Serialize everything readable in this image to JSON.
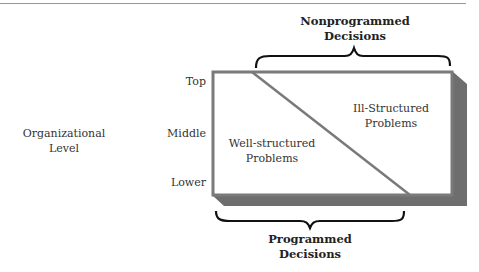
{
  "axis": {
    "title_line1": "Organizational",
    "title_line2": "Level",
    "levels": [
      "Top",
      "Middle",
      "Lower"
    ]
  },
  "regions": {
    "well_structured_line1": "Well-structured",
    "well_structured_line2": "Problems",
    "ill_structured_line1": "Ill-Structured",
    "ill_structured_line2": "Problems"
  },
  "brackets": {
    "nonprogrammed_line1": "Nonprogrammed",
    "nonprogrammed_line2": "Decisions",
    "programmed_line1": "Programmed",
    "programmed_line2": "Decisions"
  },
  "colors": {
    "box_border": "#7a7a7a",
    "shadow": "#6e6e6e",
    "text": "#333333"
  }
}
